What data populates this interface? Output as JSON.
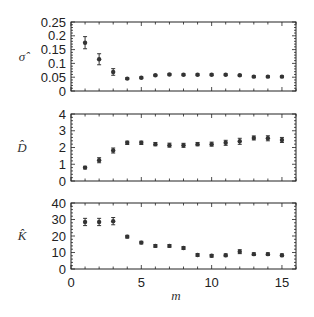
{
  "chart_data": [
    {
      "type": "scatter",
      "panel": "top",
      "ylabel": "σ̂",
      "xlabel": "",
      "ylim": [
        0,
        0.25
      ],
      "yticks": [
        0,
        0.05,
        0.1,
        0.15,
        0.2,
        0.25
      ],
      "ytick_labels": [
        "0",
        "0.05",
        "0.1",
        "0.15",
        "0.2",
        "0.25"
      ],
      "xlim": [
        0,
        16
      ],
      "x": [
        1,
        2,
        3,
        4,
        5,
        6,
        7,
        8,
        9,
        10,
        11,
        12,
        13,
        14,
        15
      ],
      "values": [
        0.175,
        0.115,
        0.069,
        0.045,
        0.048,
        0.057,
        0.06,
        0.059,
        0.059,
        0.059,
        0.059,
        0.057,
        0.052,
        0.052,
        0.052
      ],
      "errors": [
        0.022,
        0.02,
        0.012,
        0.003,
        0.003,
        0.003,
        0.003,
        0.003,
        0.003,
        0.003,
        0.003,
        0.003,
        0.003,
        0.003,
        0.003
      ]
    },
    {
      "type": "scatter",
      "panel": "middle",
      "ylabel": "D̂",
      "xlabel": "",
      "ylim": [
        0,
        4
      ],
      "yticks": [
        0,
        1,
        2,
        3,
        4
      ],
      "ytick_labels": [
        "0",
        "1",
        "2",
        "3",
        "4"
      ],
      "xlim": [
        0,
        16
      ],
      "x": [
        1,
        2,
        3,
        4,
        5,
        6,
        7,
        8,
        9,
        10,
        11,
        12,
        13,
        14,
        15
      ],
      "values": [
        0.8,
        1.24,
        1.82,
        2.28,
        2.28,
        2.2,
        2.14,
        2.13,
        2.2,
        2.2,
        2.28,
        2.37,
        2.57,
        2.55,
        2.45
      ],
      "errors": [
        0.08,
        0.15,
        0.15,
        0.1,
        0.1,
        0.1,
        0.12,
        0.12,
        0.1,
        0.12,
        0.15,
        0.18,
        0.12,
        0.15,
        0.15
      ]
    },
    {
      "type": "scatter",
      "panel": "bottom",
      "ylabel": "K̂",
      "xlabel": "m",
      "ylim": [
        0,
        40
      ],
      "yticks": [
        0,
        10,
        20,
        30,
        40
      ],
      "ytick_labels": [
        "0",
        "10",
        "20",
        "30",
        "40"
      ],
      "xlim": [
        0,
        16
      ],
      "xticks": [
        0,
        5,
        10,
        15
      ],
      "xtick_labels": [
        "0",
        "5",
        "10",
        "15"
      ],
      "x": [
        1,
        2,
        3,
        4,
        5,
        6,
        7,
        8,
        9,
        10,
        11,
        12,
        13,
        14,
        15
      ],
      "values": [
        28.5,
        28.5,
        29,
        19.6,
        16,
        14,
        14,
        12.7,
        8.5,
        8,
        8.3,
        10.5,
        9,
        9,
        8.3
      ],
      "errors": [
        2.2,
        2.2,
        2.2,
        0.8,
        0.8,
        0.8,
        0.8,
        0.8,
        0.8,
        0.8,
        0.8,
        1.2,
        0.8,
        0.8,
        0.8
      ]
    }
  ],
  "style": {
    "marker_color": "#333333",
    "frame_color": "#222222"
  }
}
